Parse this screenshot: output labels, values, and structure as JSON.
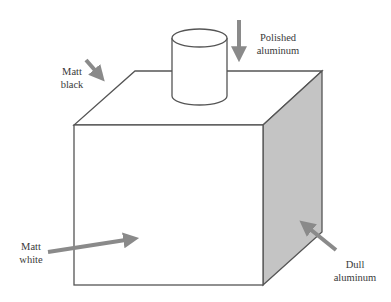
{
  "diagram": {
    "colors": {
      "outline": "#555555",
      "shaded_face": "#c4c4c4",
      "arrow": "#8a8a8a",
      "label_text": "#3a3a3a",
      "background": "#ffffff"
    },
    "labels": {
      "matt_black": {
        "line1": "Matt",
        "line2": "black"
      },
      "polished_aluminum": {
        "line1": "Polished",
        "line2": "aluminum"
      },
      "matt_white": {
        "line1": "Matt",
        "line2": "white"
      },
      "dull_aluminum": {
        "line1": "Dull",
        "line2": "aluminum"
      }
    }
  }
}
